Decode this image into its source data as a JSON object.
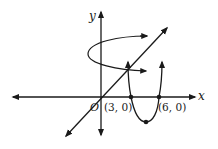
{
  "diagram": {
    "type": "coordinate-graph",
    "axes": {
      "x_label": "x",
      "y_label": "y",
      "origin_label": "O"
    },
    "points": [
      {
        "label": "(3, 0)",
        "x": 3,
        "y": 0
      },
      {
        "label": "(6, 0)",
        "x": 6,
        "y": 0
      },
      {
        "label": "",
        "x": 4.5,
        "y": "vertex"
      }
    ],
    "curves": [
      {
        "kind": "parabola",
        "roots": [
          3,
          6
        ],
        "opens": "up"
      },
      {
        "kind": "line",
        "through": "origin",
        "slope": "positive"
      },
      {
        "kind": "rotation-arrow",
        "about": "y-axis"
      }
    ],
    "colors": {
      "stroke": "#1a1a1a",
      "background": "#ffffff"
    }
  }
}
